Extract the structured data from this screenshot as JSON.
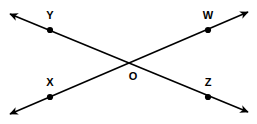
{
  "figure": {
    "kind": "geometry-diagram",
    "width": 257,
    "height": 124,
    "background_color": "#ffffff",
    "stroke_color": "#000000",
    "stroke_width": 1.6,
    "dot_color": "#000000",
    "dot_radius": 3.1,
    "label_color": "#000000",
    "label_font_size": 11
  },
  "points": [
    {
      "id": "Y",
      "label": "Y",
      "x": 50,
      "y": 30,
      "label_x": 50,
      "label_y": 15
    },
    {
      "id": "W",
      "label": "W",
      "x": 208,
      "y": 30,
      "label_x": 208,
      "label_y": 15
    },
    {
      "id": "X",
      "label": "X",
      "x": 50,
      "y": 97,
      "label_x": 50,
      "label_y": 82
    },
    {
      "id": "Z",
      "label": "Z",
      "x": 208,
      "y": 97,
      "label_x": 208,
      "label_y": 82
    },
    {
      "id": "O",
      "label": "O",
      "x": 129,
      "y": 62,
      "label_x": 133,
      "label_y": 76,
      "show_dot": false
    }
  ],
  "lines": [
    {
      "id": "line-YZ",
      "name": "line-y-o-z",
      "through": [
        "Y",
        "O",
        "Z"
      ],
      "x1": 10,
      "y1": 14,
      "x2": 248,
      "y2": 112,
      "arrow_start": true,
      "arrow_end": true
    },
    {
      "id": "line-XW",
      "name": "line-x-o-w",
      "through": [
        "X",
        "O",
        "W"
      ],
      "x1": 10,
      "y1": 114,
      "x2": 248,
      "y2": 12,
      "arrow_start": true,
      "arrow_end": true
    }
  ]
}
